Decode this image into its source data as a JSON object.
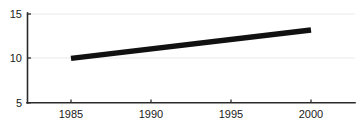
{
  "chart_data": {
    "type": "line",
    "title": "",
    "subtitle": "",
    "xlabel": "",
    "ylabel": "",
    "x": [
      1985,
      2000
    ],
    "series": [
      {
        "name": "series-1",
        "values": [
          10.0,
          13.2
        ],
        "color": "#111111",
        "line_width_px": 5.4
      }
    ],
    "xlim": [
      1982.2,
      2002.8
    ],
    "ylim": [
      5,
      15
    ],
    "x_ticks": [
      1985,
      1990,
      1995,
      2000
    ],
    "x_tick_labels": [
      "1985",
      "1990",
      "1995",
      "2000"
    ],
    "y_ticks": [
      5,
      10,
      15
    ],
    "y_tick_labels": [
      "5",
      "10",
      "15"
    ],
    "grid": "horizontal",
    "gridline_color": "#f0f0f0",
    "axis_color": "#2b2b2b",
    "background": "#ffffff",
    "legend": null,
    "legend_position": "none",
    "annotations": []
  },
  "axis_labels": {
    "y_15": "15",
    "y_10": "10",
    "y_5": "5",
    "x_1985": "1985",
    "x_1990": "1990",
    "x_1995": "1995",
    "x_2000": "2000"
  }
}
